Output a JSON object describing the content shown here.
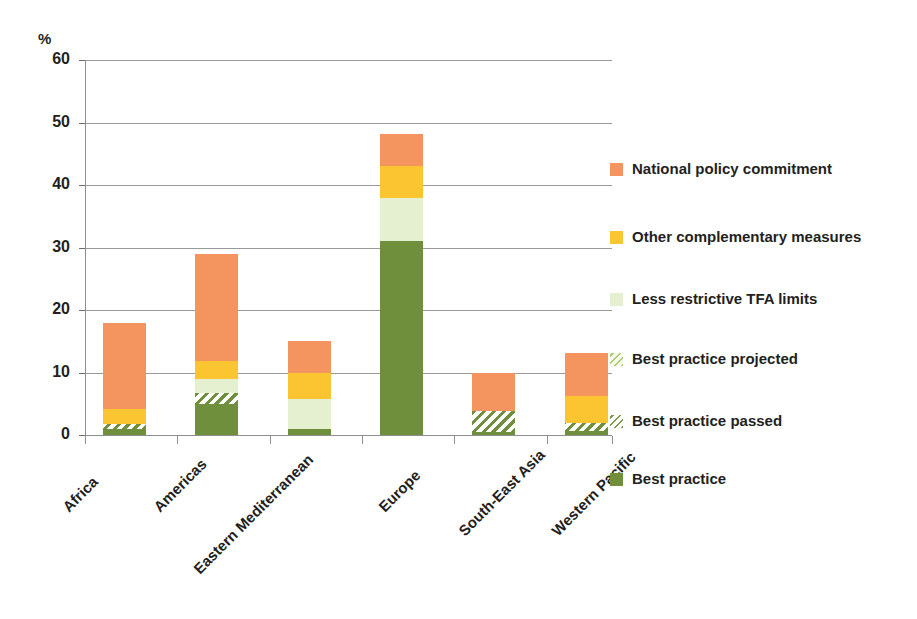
{
  "chart_data": {
    "type": "bar",
    "subtype": "stacked",
    "title": "",
    "xlabel": "",
    "ylabel": "%",
    "ylim": [
      0,
      60
    ],
    "ytick_labels": [
      "60",
      "50",
      "40",
      "30",
      "20",
      "10",
      "0"
    ],
    "ytick_values": [
      60,
      50,
      40,
      30,
      20,
      10,
      0
    ],
    "grid": true,
    "legend_position": "right",
    "categories": [
      "Africa",
      "Americas",
      "Eastern Mediterranean",
      "Europe",
      "South-East Asia",
      "Western Pacific"
    ],
    "series": [
      {
        "name": "Best practice",
        "color": "#6f8f3d",
        "values": [
          1.0,
          5.0,
          1.0,
          31.0,
          0.5,
          0.7
        ]
      },
      {
        "name": "Best practice passed",
        "color": "#6f8f3d",
        "pattern": "diagonal-hatch",
        "values": [
          0.8,
          1.8,
          0.0,
          0.0,
          3.3,
          1.3
        ]
      },
      {
        "name": "Best practice projected",
        "color": "#9dbf63",
        "pattern": "diagonal-hatch-light",
        "values": [
          0.0,
          0.0,
          0.0,
          0.0,
          0.0,
          0.0
        ]
      },
      {
        "name": "Less restrictive TFA limits",
        "color": "#e4f0d0",
        "values": [
          0.0,
          2.2,
          4.8,
          7.0,
          0.0,
          0.0
        ]
      },
      {
        "name": "Other complementary measures",
        "color": "#fbc431",
        "values": [
          2.4,
          2.8,
          4.2,
          5.1,
          0.0,
          4.3
        ]
      },
      {
        "name": "National policy commitment",
        "color": "#f4945e",
        "values": [
          13.8,
          17.2,
          5.0,
          5.1,
          6.2,
          6.9
        ]
      }
    ],
    "totals": [
      18.0,
      29.0,
      15.0,
      48.2,
      10.0,
      13.2
    ]
  },
  "axis": {
    "unit_label": "%"
  },
  "legend": {
    "items": [
      {
        "label": "National policy commitment",
        "swatch": "sw-national"
      },
      {
        "label": "Other complementary measures",
        "swatch": "sw-other"
      },
      {
        "label": "Less restrictive TFA limits",
        "swatch": "sw-less"
      },
      {
        "label": "Best practice projected",
        "swatch": "sw-proj"
      },
      {
        "label": "Best practice passed",
        "swatch": "sw-passed"
      },
      {
        "label": "Best practice",
        "swatch": "sw-best"
      }
    ]
  }
}
